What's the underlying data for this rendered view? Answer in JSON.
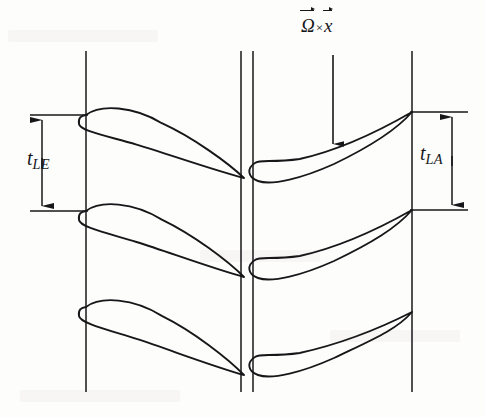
{
  "figure": {
    "type": "engineering-diagram",
    "width": 485,
    "height": 417,
    "background_color": "#fdfdfc",
    "line_color": "#17171a"
  },
  "labels": {
    "omega_cross_x": {
      "omega_symbol": "Ω",
      "times_symbol": "×",
      "x_symbol": "x",
      "full_text": "Ω⃗ × x⃗",
      "description": "rotational velocity vector label above downward arrow"
    },
    "t_le": {
      "base": "t",
      "subscript": "LE",
      "full_text": "t_LE",
      "description": "leading edge pitch dimension, left blade row"
    },
    "t_la": {
      "base": "t",
      "subscript": "LA",
      "full_text": "t_LA",
      "description": "pitch dimension, right blade row"
    }
  },
  "chart_data": {
    "type": "diagram",
    "axis_lines": [
      {
        "name": "left-station-line",
        "x": 86,
        "y1": 51,
        "y2": 392
      },
      {
        "name": "mid-station-line-a",
        "x": 241,
        "y1": 51,
        "y2": 392
      },
      {
        "name": "mid-station-line-b",
        "x": 253,
        "y1": 51,
        "y2": 392
      },
      {
        "name": "right-station-line",
        "x": 412,
        "y1": 51,
        "y2": 392
      }
    ],
    "left_blades": [
      {
        "le_x": 86,
        "le_y": 115,
        "te_x": 244,
        "te_y": 178
      },
      {
        "le_x": 86,
        "le_y": 211,
        "te_x": 244,
        "te_y": 277
      },
      {
        "le_x": 86,
        "le_y": 307,
        "te_x": 244,
        "te_y": 375
      }
    ],
    "right_blades": [
      {
        "le_x": 256,
        "le_y": 162,
        "te_x": 412,
        "te_y": 112
      },
      {
        "le_x": 256,
        "le_y": 259,
        "te_x": 412,
        "te_y": 210
      },
      {
        "le_x": 256,
        "le_y": 356,
        "te_x": 412,
        "te_y": 312
      }
    ],
    "dimension_left": {
      "label": "t_LE",
      "arrow_x": 42,
      "top_y": 115,
      "bottom_y": 211,
      "extension_to_x": 86,
      "pitch_px": 96
    },
    "dimension_right": {
      "label": "t_LA",
      "arrow_x": 452,
      "top_y": 112,
      "bottom_y": 210,
      "extension_from_x": 412,
      "pitch_px": 98
    },
    "rotation_arrow": {
      "label": "Ω⃗ × x⃗",
      "x": 333,
      "y_start": 55,
      "y_end": 144,
      "direction": "down"
    }
  }
}
